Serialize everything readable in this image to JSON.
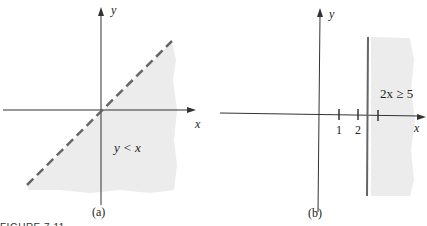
{
  "figure": {
    "caption": "FIGURE 7.11",
    "panels": [
      {
        "id": "a",
        "label": "(a)",
        "x_axis_label": "x",
        "y_axis_label": "y",
        "boundary": "dashed line y = x",
        "region_label": "y < x",
        "shaded_region": "below line y = x"
      },
      {
        "id": "b",
        "label": "(b)",
        "x_axis_label": "x",
        "y_axis_label": "y",
        "ticks": [
          "1",
          "2"
        ],
        "boundary": "solid vertical line x = 2.5",
        "region_label": "2x ≥ 5",
        "shaded_region": "right of x = 2.5"
      }
    ]
  },
  "colors": {
    "shade": "#ececec",
    "axis": "#333333",
    "boundary": "#666666"
  }
}
